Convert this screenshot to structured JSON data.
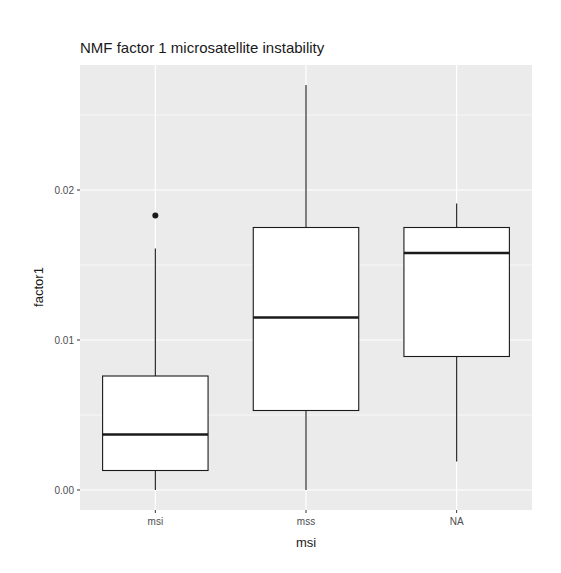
{
  "chart_data": {
    "type": "boxplot",
    "title": "NMF factor 1 microsatellite instability",
    "xlabel": "msi",
    "ylabel": "factor1",
    "categories": [
      "msi",
      "mss",
      "NA"
    ],
    "ylim": [
      -0.0008,
      0.0283
    ],
    "yticks": [
      0.0,
      0.01,
      0.02
    ],
    "ytick_labels": [
      "0.00",
      "0.01",
      "0.02"
    ],
    "grid": true,
    "legend": null,
    "boxes": [
      {
        "category": "msi",
        "whisker_low": 0.0,
        "q1": 0.0013,
        "median": 0.0037,
        "q3": 0.0076,
        "whisker_high": 0.0161,
        "outliers": [
          0.0183
        ]
      },
      {
        "category": "mss",
        "whisker_low": 0.0,
        "q1": 0.0053,
        "median": 0.0115,
        "q3": 0.0175,
        "whisker_high": 0.027,
        "outliers": []
      },
      {
        "category": "NA",
        "whisker_low": 0.0019,
        "q1": 0.0089,
        "median": 0.0158,
        "q3": 0.0175,
        "whisker_high": 0.0191,
        "outliers": []
      }
    ]
  },
  "colors": {
    "panel_background": "#ebebeb",
    "grid": "#ffffff",
    "box_fill": "#ffffff",
    "box_stroke": "#1a1a1a"
  }
}
